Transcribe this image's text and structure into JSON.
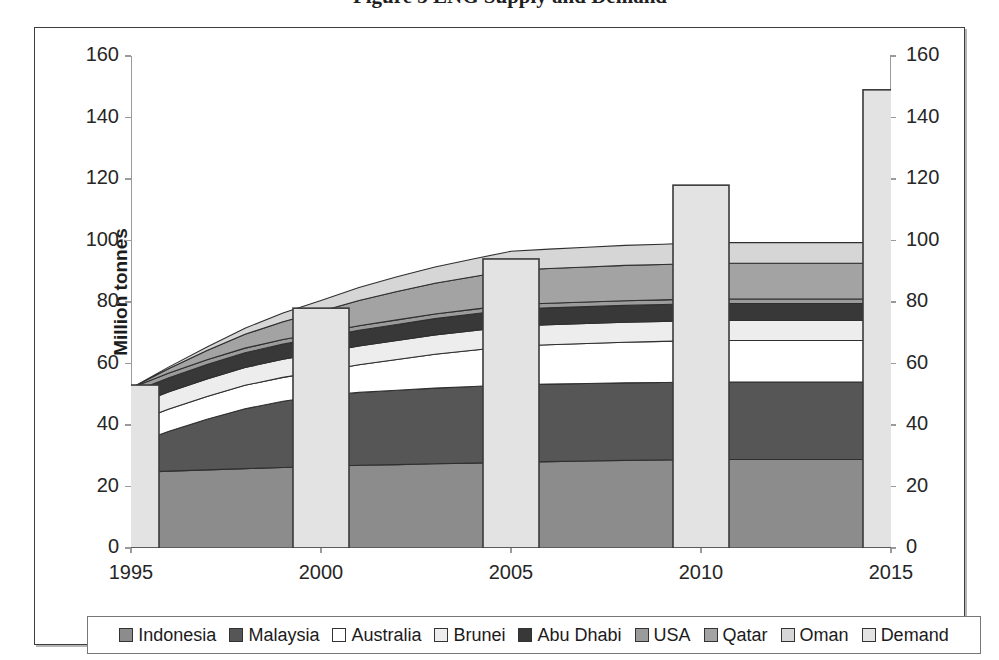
{
  "figure": {
    "title_partial": "Figure 3  LNG Supply  and  Demand",
    "background": "#ffffff",
    "frame_color": "#3d3d3d"
  },
  "axes": {
    "y_label": "Million tonnes",
    "y_ticks": [
      0,
      20,
      40,
      60,
      80,
      100,
      120,
      140,
      160
    ],
    "y_min": 0,
    "y_max": 160,
    "y_right_ticks": [
      0,
      20,
      40,
      60,
      80,
      100,
      120,
      140,
      160
    ],
    "x_tick_labels": [
      "1995",
      "2000",
      "2005",
      "2010",
      "2015"
    ],
    "axis_color": "#9a9a9a"
  },
  "legend": {
    "items": [
      {
        "label": "Indonesia",
        "color": "#8c8c8c"
      },
      {
        "label": "Malaysia",
        "color": "#565656"
      },
      {
        "label": "Australia",
        "color": "#ffffff"
      },
      {
        "label": "Brunei",
        "color": "#ededed"
      },
      {
        "label": "Abu Dhabi",
        "color": "#383838"
      },
      {
        "label": "USA",
        "color": "#9b9b9b"
      },
      {
        "label": "Qatar",
        "color": "#a3a3a3"
      },
      {
        "label": "Oman",
        "color": "#d6d6d6"
      },
      {
        "label": "Demand",
        "color": "#e3e3e3"
      }
    ]
  },
  "chart_data": {
    "type": "area",
    "title": "Figure 3  LNG Supply  and  Demand",
    "xlabel": "",
    "ylabel": "Million tonnes",
    "ylim": [
      0,
      160
    ],
    "grid": false,
    "legend_position": "bottom",
    "x": [
      "1995",
      "1996",
      "1997",
      "1998",
      "1999",
      "2000",
      "2001",
      "2002",
      "2003",
      "2004",
      "2005",
      "2006",
      "2007",
      "2008",
      "2009",
      "2010",
      "2011",
      "2012",
      "2013",
      "2014",
      "2015"
    ],
    "series": [
      {
        "name": "Indonesia",
        "kind": "stacked-area",
        "color": "#8c8c8c",
        "values": [
          24.5,
          25.0,
          25.4,
          25.8,
          26.2,
          26.5,
          26.9,
          27.1,
          27.4,
          27.6,
          27.9,
          28.1,
          28.3,
          28.5,
          28.6,
          28.8,
          28.8,
          28.8,
          28.8,
          28.8,
          28.8
        ]
      },
      {
        "name": "Malaysia",
        "kind": "stacked-area",
        "color": "#565656",
        "values": [
          9.0,
          13.0,
          16.5,
          19.5,
          21.5,
          23.0,
          23.7,
          24.2,
          24.6,
          24.9,
          25.2,
          25.2,
          25.2,
          25.2,
          25.2,
          25.2,
          25.2,
          25.2,
          25.2,
          25.2,
          25.2
        ]
      },
      {
        "name": "Australia",
        "kind": "stacked-area",
        "color": "#ffffff",
        "values": [
          7.0,
          7.2,
          7.4,
          7.6,
          7.8,
          8.0,
          9.0,
          10.0,
          11.0,
          11.8,
          12.5,
          12.8,
          13.0,
          13.2,
          13.4,
          13.5,
          13.5,
          13.5,
          13.5,
          13.5,
          13.5
        ]
      },
      {
        "name": "Brunei",
        "kind": "stacked-area",
        "color": "#ededed",
        "values": [
          5.5,
          5.6,
          5.7,
          5.8,
          5.9,
          6.0,
          6.1,
          6.2,
          6.3,
          6.4,
          6.5,
          6.5,
          6.5,
          6.5,
          6.5,
          6.5,
          6.5,
          6.5,
          6.5,
          6.5,
          6.5
        ]
      },
      {
        "name": "Abu Dhabi",
        "kind": "stacked-area",
        "color": "#383838",
        "values": [
          4.5,
          4.6,
          4.7,
          4.8,
          4.9,
          5.0,
          5.1,
          5.2,
          5.3,
          5.4,
          5.5,
          5.5,
          5.5,
          5.5,
          5.5,
          5.5,
          5.5,
          5.5,
          5.5,
          5.5,
          5.5
        ]
      },
      {
        "name": "USA",
        "kind": "stacked-area",
        "color": "#9b9b9b",
        "values": [
          1.5,
          1.5,
          1.5,
          1.5,
          1.5,
          1.5,
          1.5,
          1.5,
          1.5,
          1.5,
          1.5,
          1.5,
          1.5,
          1.5,
          1.5,
          1.5,
          1.5,
          1.5,
          1.5,
          1.5,
          1.5
        ]
      },
      {
        "name": "Qatar",
        "kind": "stacked-area",
        "color": "#a3a3a3",
        "values": [
          0.0,
          1.5,
          3.0,
          4.5,
          5.8,
          7.0,
          8.2,
          9.2,
          10.0,
          10.6,
          11.2,
          11.3,
          11.4,
          11.5,
          11.5,
          11.6,
          11.6,
          11.6,
          11.6,
          11.6,
          11.6
        ]
      },
      {
        "name": "Oman",
        "kind": "stacked-area",
        "color": "#d6d6d6",
        "values": [
          0.0,
          0.5,
          1.2,
          2.0,
          2.8,
          3.5,
          4.2,
          4.8,
          5.3,
          5.8,
          6.2,
          6.3,
          6.4,
          6.5,
          6.6,
          6.7,
          6.7,
          6.7,
          6.7,
          6.7,
          6.7
        ]
      }
    ],
    "bars": {
      "name": "Demand",
      "color": "#e3e3e3",
      "categories": [
        "1995",
        "2000",
        "2005",
        "2010",
        "2015"
      ],
      "values": [
        53,
        78,
        94,
        118,
        149
      ]
    }
  }
}
